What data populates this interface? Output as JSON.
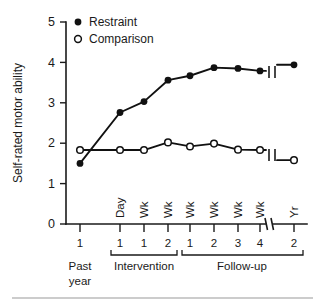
{
  "chart_data": {
    "type": "line",
    "title": "",
    "xlabel": "",
    "ylabel": "Self-rated motor ability",
    "ylim": [
      0,
      5
    ],
    "yticks": [
      0,
      1,
      2,
      3,
      4,
      5
    ],
    "ytick_labels": [
      "0",
      "1",
      "2",
      "3",
      "4",
      "5"
    ],
    "grid": false,
    "legend_position": "top-left",
    "axis_break": true,
    "axis_break_note": "break in x-axis between Follow-up Wk 4 and Follow-up Yr 2",
    "x_categories": [
      {
        "unit": "",
        "number": "1",
        "group": "Past year"
      },
      {
        "unit": "Day",
        "number": "1",
        "group": "Intervention"
      },
      {
        "unit": "Wk",
        "number": "1",
        "group": "Intervention"
      },
      {
        "unit": "Wk",
        "number": "2",
        "group": "Intervention"
      },
      {
        "unit": "Wk",
        "number": "1",
        "group": "Follow-up"
      },
      {
        "unit": "Wk",
        "number": "2",
        "group": "Follow-up"
      },
      {
        "unit": "Wk",
        "number": "3",
        "group": "Follow-up"
      },
      {
        "unit": "Wk",
        "number": "4",
        "group": "Follow-up"
      },
      {
        "unit": "Yr",
        "number": "2",
        "group": "Follow-up"
      }
    ],
    "x_group_labels": [
      "Past year",
      "Intervention",
      "Follow-up"
    ],
    "x_group_label_past_line1": "Past",
    "x_group_label_past_line2": "year",
    "x_group_label_intervention": "Intervention",
    "x_group_label_followup": "Follow-up",
    "series": [
      {
        "name": "Restraint",
        "marker": "filled-circle",
        "color": "#111111",
        "values": [
          1.5,
          2.76,
          3.03,
          3.56,
          3.67,
          3.87,
          3.85,
          3.79,
          3.94
        ]
      },
      {
        "name": "Comparison",
        "marker": "open-circle",
        "color": "#111111",
        "values": [
          1.83,
          1.83,
          1.83,
          2.02,
          1.92,
          1.99,
          1.84,
          1.83,
          1.58
        ]
      }
    ],
    "legend": [
      {
        "label": "Restraint",
        "marker": "filled-circle"
      },
      {
        "label": "Comparison",
        "marker": "open-circle"
      }
    ]
  }
}
